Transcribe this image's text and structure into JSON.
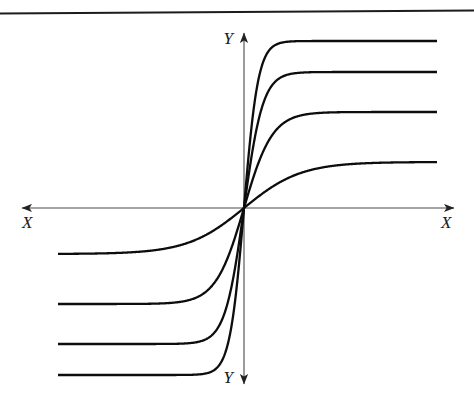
{
  "figure": {
    "background_color": "#ffffff",
    "border_rule_color": "#1c1c1c",
    "curve_color": "#0d0d0d",
    "axis_color": "#4a4a4a",
    "curve_width": 2.3,
    "axis_width": 1.1
  },
  "axes": {
    "origin": {
      "x": 244,
      "y": 208
    },
    "x_axis": {
      "label_left": "X",
      "label_right": "X",
      "left_arrow_tip_x": 20,
      "right_arrow_tip_x": 456,
      "y": 208,
      "label_left_pos": {
        "x": 22,
        "y": 228
      },
      "label_right_pos": {
        "x": 441,
        "y": 228
      }
    },
    "y_axis": {
      "label_top": "Y",
      "label_bottom": "Y",
      "top_arrow_tip_y": 31,
      "bottom_arrow_tip_y": 386,
      "x": 244,
      "label_top_pos": {
        "x": 227,
        "y": 44
      },
      "label_bottom_pos": {
        "x": 227,
        "y": 382
      }
    }
  },
  "chart_data": {
    "type": "line",
    "xlabel": "X",
    "ylabel": "Y",
    "grid": false,
    "legend": false,
    "xlim": [
      -1,
      1
    ],
    "ylim": [
      -1,
      1
    ],
    "series": [
      {
        "name": "curve-1-highest-gain",
        "gain": 4,
        "plateau_positive_px": 41,
        "plateau_negative_px": 375,
        "plateau_positive_value": 0.94,
        "plateau_negative_value": -0.94,
        "knee_positive_px": {
          "x": 296,
          "y": 41
        },
        "knee_negative_px": {
          "x": 192,
          "y": 375
        },
        "plateau_start_px": 58,
        "plateau_end_px": 437
      },
      {
        "name": "curve-2-high-gain",
        "gain": 3,
        "plateau_positive_px": 72,
        "plateau_negative_px": 344,
        "plateau_positive_value": 0.76,
        "plateau_negative_value": -0.76,
        "knee_positive_px": {
          "x": 288,
          "y": 72
        },
        "knee_negative_px": {
          "x": 200,
          "y": 344
        },
        "plateau_start_px": 58,
        "plateau_end_px": 437
      },
      {
        "name": "curve-3-medium-gain",
        "gain": 2,
        "plateau_positive_px": 112,
        "plateau_negative_px": 304,
        "plateau_positive_value": 0.54,
        "plateau_negative_value": -0.54,
        "knee_positive_px": {
          "x": 290,
          "y": 112
        },
        "knee_negative_px": {
          "x": 198,
          "y": 304
        },
        "plateau_start_px": 58,
        "plateau_end_px": 437
      },
      {
        "name": "curve-4-low-gain",
        "gain": 1,
        "plateau_positive_px": 162,
        "plateau_negative_px": 254,
        "plateau_positive_value": 0.26,
        "plateau_negative_value": -0.26,
        "knee_positive_px": {
          "x": 283,
          "y": 162
        },
        "knee_negative_px": {
          "x": 205,
          "y": 254
        },
        "plateau_start_px": 58,
        "plateau_end_px": 437
      }
    ]
  }
}
